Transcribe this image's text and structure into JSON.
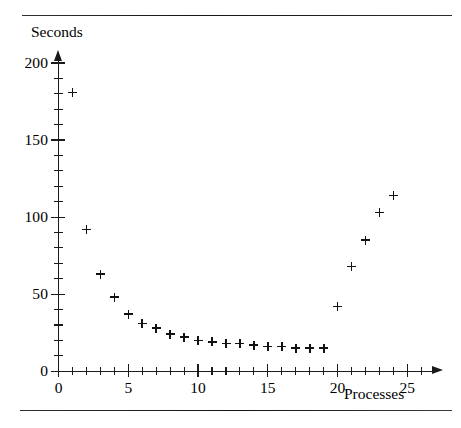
{
  "figure": {
    "name": "seconds-vs-processes-scatter",
    "rule_top": true,
    "rule_bottom": true
  },
  "chart_data": {
    "type": "scatter",
    "title": "",
    "subtitle": "",
    "xlabel": "Processes",
    "ylabel": "Seconds",
    "xlim": [
      0,
      25.5
    ],
    "ylim": [
      0,
      202
    ],
    "grid": false,
    "legend": null,
    "marker": "plus",
    "marker_color": "#121212",
    "x_tick_labels": [
      "0",
      "5",
      "10",
      "15",
      "20",
      "25"
    ],
    "x_tick_values": [
      0,
      5,
      10,
      15,
      20,
      25
    ],
    "x_minor_tick_step": 1,
    "y_tick_labels": [
      "0",
      "50",
      "100",
      "150",
      "200"
    ],
    "y_tick_values": [
      0,
      50,
      100,
      150,
      200
    ],
    "y_minor_tick_step": 10,
    "x": [
      1,
      2,
      3,
      4,
      5,
      6,
      7,
      8,
      9,
      10,
      11,
      12,
      13,
      14,
      15,
      16,
      17,
      18,
      19,
      20,
      21,
      22,
      23,
      24
    ],
    "y": [
      181,
      92,
      63,
      48,
      37,
      31,
      28,
      24,
      22,
      20,
      19,
      18,
      18,
      17,
      16,
      16,
      15,
      15,
      15,
      42,
      68,
      85,
      103,
      114
    ],
    "points": [
      {
        "x": 1,
        "y": 181
      },
      {
        "x": 2,
        "y": 92
      },
      {
        "x": 3,
        "y": 63
      },
      {
        "x": 4,
        "y": 48
      },
      {
        "x": 5,
        "y": 37
      },
      {
        "x": 6,
        "y": 31
      },
      {
        "x": 7,
        "y": 28
      },
      {
        "x": 8,
        "y": 24
      },
      {
        "x": 9,
        "y": 22
      },
      {
        "x": 10,
        "y": 20
      },
      {
        "x": 11,
        "y": 19
      },
      {
        "x": 12,
        "y": 18
      },
      {
        "x": 13,
        "y": 18
      },
      {
        "x": 14,
        "y": 17
      },
      {
        "x": 15,
        "y": 16
      },
      {
        "x": 16,
        "y": 16
      },
      {
        "x": 17,
        "y": 15
      },
      {
        "x": 18,
        "y": 15
      },
      {
        "x": 19,
        "y": 15
      },
      {
        "x": 20,
        "y": 42
      },
      {
        "x": 21,
        "y": 68
      },
      {
        "x": 22,
        "y": 85
      },
      {
        "x": 23,
        "y": 103
      },
      {
        "x": 24,
        "y": 114
      }
    ]
  }
}
